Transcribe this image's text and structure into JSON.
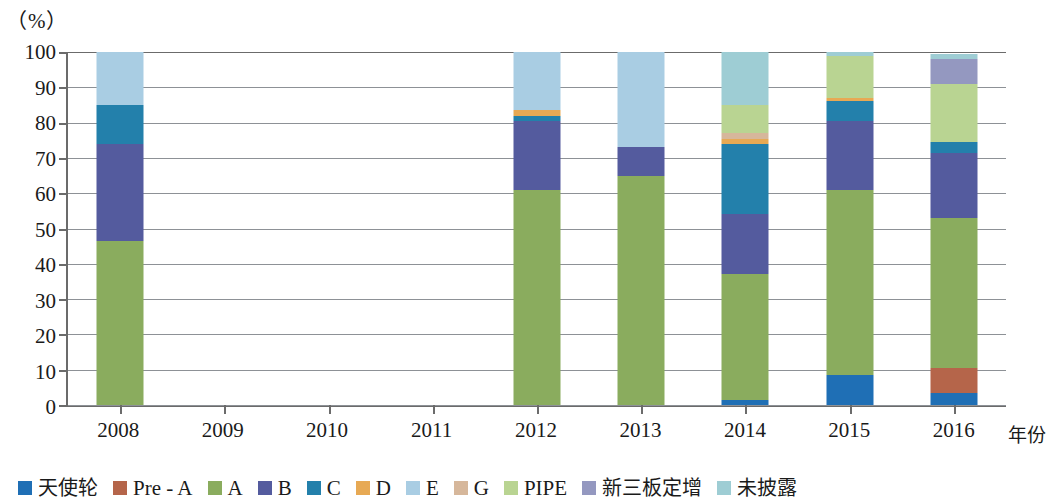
{
  "unit_label": "（%）",
  "axis_title_x": "年份",
  "y_axis": {
    "ticks": [
      "0",
      "10",
      "20",
      "30",
      "40",
      "50",
      "60",
      "70",
      "80",
      "90",
      "100"
    ],
    "min": 0,
    "max": 100
  },
  "legend": {
    "items": [
      {
        "label": "天使轮",
        "color": "#1f6fb5",
        "cjk": true
      },
      {
        "label": "Pre - A",
        "color": "#b5654a",
        "cjk": false
      },
      {
        "label": "A",
        "color": "#8aac5e",
        "cjk": false
      },
      {
        "label": "B",
        "color": "#545b9e",
        "cjk": false
      },
      {
        "label": "C",
        "color": "#2380ab",
        "cjk": false
      },
      {
        "label": "D",
        "color": "#e7a954",
        "cjk": false
      },
      {
        "label": "E",
        "color": "#a9cde3",
        "cjk": false
      },
      {
        "label": "G",
        "color": "#d6b79b",
        "cjk": false
      },
      {
        "label": "PIPE",
        "color": "#b9d492",
        "cjk": false
      },
      {
        "label": "新三板定增",
        "color": "#9498c0",
        "cjk": true
      },
      {
        "label": "未披露",
        "color": "#9ecdd4",
        "cjk": true
      }
    ]
  },
  "chart_data": {
    "type": "bar",
    "stacked": true,
    "title": "",
    "xlabel": "年份",
    "ylabel": "（%）",
    "ylim": [
      0,
      100
    ],
    "grid": true,
    "legend_position": "bottom",
    "categories": [
      "2008",
      "2009",
      "2010",
      "2011",
      "2012",
      "2013",
      "2014",
      "2015",
      "2016"
    ],
    "series": [
      {
        "name": "天使轮",
        "color": "#1f6fb5",
        "values": [
          0,
          0,
          0,
          0,
          0,
          0,
          1.5,
          8.5,
          3.5
        ]
      },
      {
        "name": "Pre - A",
        "color": "#b5654a",
        "values": [
          0,
          0,
          0,
          0,
          0,
          0,
          0,
          0,
          7.0
        ]
      },
      {
        "name": "A",
        "color": "#8aac5e",
        "values": [
          46.5,
          0,
          0,
          0,
          61.0,
          65.0,
          35.5,
          52.5,
          42.5
        ]
      },
      {
        "name": "B",
        "color": "#545b9e",
        "values": [
          27.5,
          0,
          0,
          0,
          19.5,
          8.0,
          17.0,
          19.5,
          18.5
        ]
      },
      {
        "name": "C",
        "color": "#2380ab",
        "values": [
          11.0,
          0,
          0,
          0,
          1.5,
          0,
          20.0,
          5.5,
          3.0
        ]
      },
      {
        "name": "D",
        "color": "#e7a954",
        "values": [
          0,
          0,
          0,
          0,
          1.5,
          0,
          1.5,
          1.0,
          0
        ]
      },
      {
        "name": "E",
        "color": "#a9cde3",
        "values": [
          15.0,
          0,
          0,
          0,
          16.5,
          27.0,
          0,
          0,
          0
        ]
      },
      {
        "name": "G",
        "color": "#d6b79b",
        "values": [
          0,
          0,
          0,
          0,
          0,
          0,
          1.5,
          0,
          0
        ]
      },
      {
        "name": "PIPE",
        "color": "#b9d492",
        "values": [
          0,
          0,
          0,
          0,
          0,
          0,
          8.0,
          12.0,
          16.5
        ]
      },
      {
        "name": "新三板定增",
        "color": "#9498c0",
        "values": [
          0,
          0,
          0,
          0,
          0,
          0,
          0,
          0,
          7.0
        ]
      },
      {
        "name": "未披露",
        "color": "#9ecdd4",
        "values": [
          0,
          0,
          0,
          0,
          0,
          0,
          15.0,
          1.0,
          1.5
        ]
      }
    ]
  }
}
